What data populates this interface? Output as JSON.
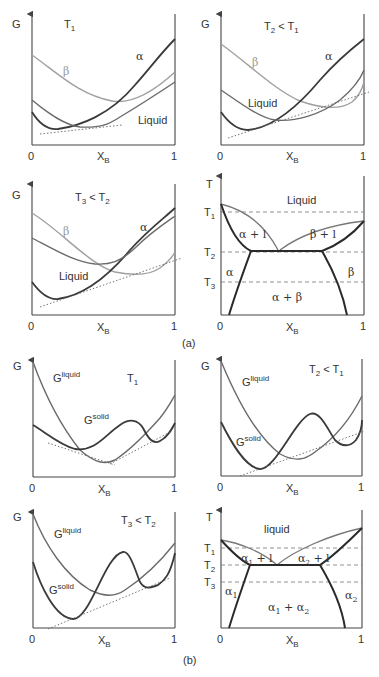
{
  "figure": {
    "part_a_label": "(a)",
    "part_b_label": "(b)"
  },
  "common": {
    "g_axis": "G",
    "t_axis": "T",
    "x_axis": "X",
    "x_sub": "B",
    "x_min": "0",
    "x_max": "1"
  },
  "panels": {
    "a1": {
      "temp": "T",
      "temp_sub": "1",
      "temp_rest": "",
      "alpha": "α",
      "beta": "β",
      "liquid": "Liquid"
    },
    "a2": {
      "temp": "T",
      "temp_sub": "2",
      "temp_rest": " < T",
      "temp_rest_sub": "1",
      "alpha": "α",
      "beta": "β",
      "liquid": "Liquid"
    },
    "a3": {
      "temp": "T",
      "temp_sub": "3",
      "temp_rest": " < T",
      "temp_rest_sub": "2",
      "alpha": "α",
      "beta": "β",
      "liquid": "Liquid"
    },
    "a4": {
      "liquid": "Liquid",
      "alpha_l": "α + l",
      "beta_l": "β + l",
      "alpha": "α",
      "beta": "β",
      "alpha_beta": "α + β",
      "t1": "T",
      "t1_sub": "1",
      "t2": "T",
      "t2_sub": "2",
      "t3": "T",
      "t3_sub": "3"
    },
    "b1": {
      "temp": "T",
      "temp_sub": "1",
      "g_liquid": "G",
      "g_liquid_sup": "liquid",
      "g_solid": "G",
      "g_solid_sup": "solid"
    },
    "b2": {
      "temp": "T",
      "temp_sub": "2",
      "temp_rest": " < T",
      "temp_rest_sub": "1",
      "g_liquid": "G",
      "g_liquid_sup": "liquid",
      "g_solid": "G",
      "g_solid_sup": "solid"
    },
    "b3": {
      "temp": "T",
      "temp_sub": "3",
      "temp_rest": " < T",
      "temp_rest_sub": "2",
      "g_liquid": "G",
      "g_liquid_sup": "liquid",
      "g_solid": "G",
      "g_solid_sup": "solid"
    },
    "b4": {
      "liquid": "liquid",
      "a1_l": "α",
      "a1_l_sub": "1",
      "a1_l_rest": " + l",
      "a2_l": "α",
      "a2_l_sub": "2",
      "a2_l_rest": " + l",
      "a1": "α",
      "a1_sub": "1",
      "a2": "α",
      "a2_sub": "2",
      "a1a2": "α",
      "a1a2_sub1": "1",
      "a1a2_mid": " + α",
      "a1a2_sub2": "2",
      "t1": "T",
      "t1_sub": "1",
      "t2": "T",
      "t2_sub": "2",
      "t3": "T",
      "t3_sub": "3"
    }
  }
}
